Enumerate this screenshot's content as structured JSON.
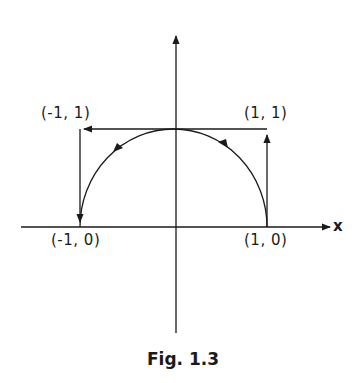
{
  "figure": {
    "caption": "Fig. 1.3",
    "axis_x_label": "x",
    "points": {
      "top_left": "(-1, 1)",
      "top_right": "(1, 1)",
      "bottom_left": "(-1, 0)",
      "bottom_right": "(1, 0)"
    },
    "paths": [
      {
        "name": "square-path",
        "description": "from (1,0) up to (1,1), left to (-1,1), down to (-1,0)"
      },
      {
        "name": "semicircle-path",
        "description": "upper unit semicircle traversed counterclockwise from (1,0) to (-1,0)"
      }
    ],
    "stroke_color": "#1a1a1a"
  }
}
